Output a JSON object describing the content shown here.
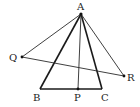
{
  "figure": {
    "type": "geometry",
    "points": {
      "A": {
        "label": "A"
      },
      "B": {
        "label": "B"
      },
      "C": {
        "label": "C"
      },
      "P": {
        "label": "P"
      },
      "Q": {
        "label": "Q"
      },
      "R": {
        "label": "R"
      }
    },
    "segments": [
      {
        "from": "A",
        "to": "B",
        "style": "thick"
      },
      {
        "from": "A",
        "to": "C",
        "style": "thick"
      },
      {
        "from": "B",
        "to": "C",
        "style": "thick"
      },
      {
        "from": "A",
        "to": "P",
        "style": "thin"
      },
      {
        "from": "A",
        "to": "Q",
        "style": "thin"
      },
      {
        "from": "A",
        "to": "R",
        "style": "thin"
      },
      {
        "from": "Q",
        "to": "R",
        "style": "thin"
      }
    ],
    "marked_points": [
      "A",
      "P",
      "Q",
      "R"
    ]
  }
}
